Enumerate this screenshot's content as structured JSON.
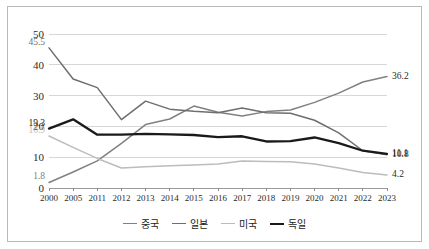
{
  "chart_data": {
    "type": "line",
    "title": "",
    "xlabel": "",
    "ylabel": "",
    "ylim": [
      0,
      50
    ],
    "yticks": [
      0,
      10,
      20,
      30,
      40,
      50
    ],
    "grid": true,
    "legend_position": "bottom",
    "categories": [
      "2000",
      "2005",
      "2011",
      "2012",
      "2013",
      "2014",
      "2015",
      "2016",
      "2017",
      "2018",
      "2019",
      "2020",
      "2021",
      "2022",
      "2023"
    ],
    "series": [
      {
        "name": "중국",
        "color": "#808080",
        "values": [
          1.8,
          5.2,
          8.8,
          14.5,
          20.6,
          22.4,
          26.6,
          24.6,
          23.4,
          24.8,
          25.3,
          27.8,
          30.8,
          34.4,
          36.2
        ],
        "start_label": "1.8",
        "end_label": "36.2"
      },
      {
        "name": "일본",
        "color": "#6e6e6e",
        "values": [
          45.5,
          35.4,
          32.6,
          22.2,
          28.2,
          25.6,
          24.9,
          24.4,
          26.0,
          24.4,
          24.3,
          22.0,
          17.9,
          12.1,
          10.8
        ],
        "start_label": "45.5",
        "end_label": "10.8"
      },
      {
        "name": "미국",
        "color": "#bcbcbc",
        "values": [
          16.9,
          13.2,
          9.6,
          6.5,
          6.9,
          7.2,
          7.5,
          7.8,
          8.8,
          8.6,
          8.5,
          7.8,
          6.5,
          5.0,
          4.2
        ],
        "start_label": "16.9",
        "end_label": "4.2"
      },
      {
        "name": "독일",
        "color": "#1a1a1a",
        "values": [
          19.3,
          22.3,
          17.3,
          17.3,
          17.6,
          17.4,
          17.2,
          16.5,
          16.8,
          15.1,
          15.2,
          16.4,
          14.6,
          12.1,
          11.1
        ],
        "start_label": "19.3",
        "end_label": "11.1"
      }
    ]
  }
}
